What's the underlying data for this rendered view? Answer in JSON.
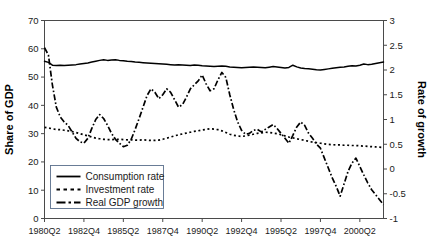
{
  "chart_data": {
    "type": "line",
    "title": "",
    "xlabel": "",
    "ylabel": "Share of GDP",
    "y2label": "Rate of growth",
    "grid": false,
    "legend_position": "bottom-left-inside",
    "ylim": [
      0,
      70
    ],
    "y2lim": [
      -1,
      3
    ],
    "yticks": [
      0,
      10,
      20,
      30,
      40,
      50,
      60,
      70
    ],
    "ytick_labels": [
      "0",
      "10",
      "20",
      "30",
      "40",
      "50",
      "60",
      "70"
    ],
    "y2ticks": [
      -1,
      -0.5,
      0,
      0.5,
      1,
      1.5,
      2,
      2.5,
      3
    ],
    "y2tick_labels": [
      "-1",
      "-0.5",
      "0",
      "0.5",
      "1",
      "1.5",
      "2",
      "2.5",
      "3"
    ],
    "xtick_labels": [
      "1980Q2",
      "1982Q4",
      "1985Q2",
      "1987Q4",
      "1990Q2",
      "1992Q4",
      "1995Q2",
      "1997Q4",
      "2000Q2"
    ],
    "xtick_index": [
      0,
      10,
      20,
      30,
      40,
      50,
      60,
      70,
      80
    ],
    "x_index_range": [
      0,
      86
    ],
    "series": [
      {
        "name": "Consumption rate",
        "axis": "left",
        "style": "solid",
        "color": "#000000",
        "values": [
          55.6,
          55.2,
          54.2,
          54.1,
          54.2,
          54.1,
          54.2,
          54.3,
          54.4,
          54.6,
          54.8,
          55.0,
          55.3,
          55.6,
          55.9,
          56.1,
          55.9,
          56.0,
          56.1,
          55.9,
          55.8,
          55.6,
          55.5,
          55.3,
          55.2,
          55.1,
          55.0,
          54.9,
          54.8,
          54.7,
          54.6,
          54.5,
          54.4,
          54.3,
          54.4,
          54.3,
          54.2,
          54.1,
          54.3,
          54.2,
          54.0,
          53.9,
          53.8,
          53.7,
          53.8,
          53.9,
          53.8,
          53.6,
          53.5,
          53.4,
          53.3,
          53.4,
          53.5,
          53.6,
          53.5,
          53.4,
          53.3,
          53.5,
          53.7,
          53.6,
          53.4,
          53.2,
          53.4,
          54.2,
          53.6,
          53.2,
          53.0,
          52.9,
          52.8,
          52.6,
          52.5,
          52.7,
          52.9,
          53.1,
          53.3,
          53.5,
          53.6,
          53.8,
          54.0,
          53.9,
          54.2,
          54.6,
          54.4,
          54.5,
          54.8,
          55.1,
          55.3
        ]
      },
      {
        "name": "Investment rate",
        "axis": "left",
        "style": "dotted",
        "color": "#000000",
        "values": [
          32.2,
          32.0,
          31.7,
          31.5,
          31.4,
          31.2,
          31.0,
          30.7,
          30.4,
          30.0,
          29.6,
          29.2,
          28.8,
          28.4,
          28.2,
          28.0,
          27.9,
          27.9,
          28.0,
          28.0,
          27.9,
          27.8,
          27.8,
          27.7,
          27.7,
          27.8,
          27.7,
          27.6,
          27.6,
          27.7,
          28.0,
          28.4,
          28.8,
          29.2,
          29.6,
          29.9,
          30.2,
          30.5,
          30.8,
          31.0,
          31.3,
          31.5,
          31.7,
          31.6,
          31.4,
          31.0,
          30.4,
          29.8,
          29.4,
          29.2,
          29.0,
          29.2,
          29.5,
          29.8,
          30.1,
          30.3,
          30.5,
          30.4,
          30.2,
          30.0,
          29.6,
          29.2,
          28.8,
          28.5,
          28.2,
          27.9,
          27.6,
          27.3,
          27.0,
          26.8,
          26.6,
          26.4,
          26.2,
          26.1,
          26.0,
          26.0,
          25.9,
          25.9,
          25.8,
          25.8,
          25.7,
          25.6,
          25.5,
          25.4,
          25.3,
          25.2,
          25.1
        ]
      },
      {
        "name": "Real GDP growth",
        "axis": "right",
        "style": "dashdot",
        "color": "#000000",
        "values": [
          2.45,
          2.3,
          1.7,
          1.25,
          1.05,
          0.95,
          0.88,
          0.75,
          0.62,
          0.55,
          0.52,
          0.62,
          0.82,
          1.0,
          1.1,
          1.02,
          0.88,
          0.72,
          0.6,
          0.52,
          0.45,
          0.48,
          0.6,
          0.8,
          1.02,
          1.25,
          1.48,
          1.62,
          1.55,
          1.42,
          1.5,
          1.62,
          1.55,
          1.4,
          1.25,
          1.3,
          1.45,
          1.62,
          1.7,
          1.78,
          1.9,
          1.72,
          1.58,
          1.62,
          1.8,
          1.95,
          1.85,
          1.5,
          1.2,
          0.95,
          0.78,
          0.7,
          0.72,
          0.78,
          0.8,
          0.75,
          0.8,
          0.85,
          0.9,
          0.82,
          0.72,
          0.62,
          0.52,
          0.68,
          0.85,
          0.95,
          0.88,
          0.72,
          0.62,
          0.5,
          0.42,
          0.22,
          0.02,
          -0.18,
          -0.35,
          -0.55,
          -0.3,
          -0.05,
          0.12,
          0.22,
          0.05,
          -0.12,
          -0.28,
          -0.42,
          -0.52,
          -0.62,
          -0.72
        ]
      }
    ]
  },
  "legend": {
    "items": [
      {
        "label": "Consumption rate",
        "style": "solid"
      },
      {
        "label": "Investment rate",
        "style": "dotted"
      },
      {
        "label": "Real GDP growth",
        "style": "dashdot"
      }
    ]
  }
}
